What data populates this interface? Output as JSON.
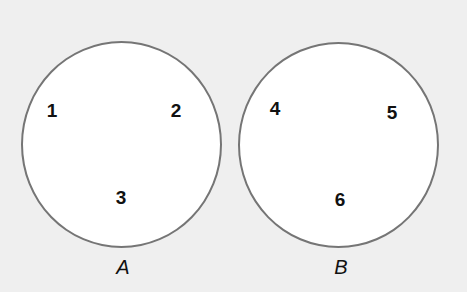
{
  "diagram": {
    "type": "sets",
    "background_color": "#efefef",
    "sets": [
      {
        "name": "A",
        "label": "A",
        "elements": [
          "1",
          "2",
          "3"
        ]
      },
      {
        "name": "B",
        "label": "B",
        "elements": [
          "4",
          "5",
          "6"
        ]
      }
    ]
  }
}
